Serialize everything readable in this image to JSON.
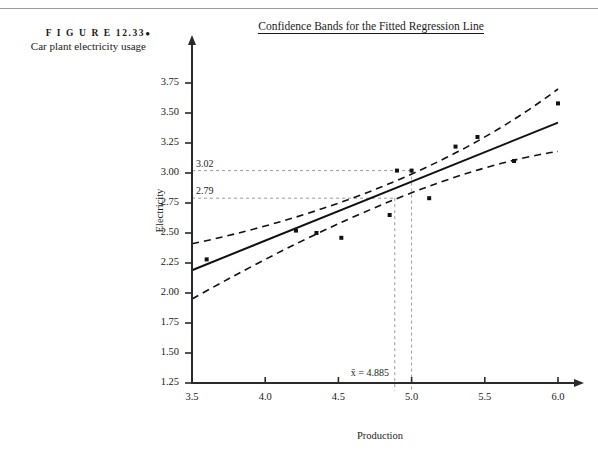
{
  "figure": {
    "label": "F I G U R E  12.33",
    "bullet": "●",
    "description": "Car plant electricity usage"
  },
  "chart_title": "Confidence Bands for the Fitted Regression Line",
  "chart_data": {
    "type": "scatter",
    "title": "Confidence Bands for the Fitted Regression Line",
    "xlabel": "Production",
    "ylabel": "Electricity",
    "xlim": [
      3.5,
      6.0
    ],
    "ylim": [
      1.25,
      3.75
    ],
    "xticks": [
      "3.5",
      "4.0",
      "4.5",
      "5.0",
      "5.5",
      "6.0"
    ],
    "xtick_values": [
      3.5,
      4.0,
      4.5,
      5.0,
      5.5,
      6.0
    ],
    "yticks": [
      "1.25",
      "1.50",
      "1.75",
      "2.00",
      "2.25",
      "2.50",
      "2.75",
      "3.00",
      "3.25",
      "3.50",
      "3.75"
    ],
    "ytick_values": [
      1.25,
      1.5,
      1.75,
      2.0,
      2.25,
      2.5,
      2.75,
      3.0,
      3.25,
      3.5,
      3.75
    ],
    "grid": false,
    "legend": "none",
    "points": [
      {
        "x": 3.6,
        "y": 2.28
      },
      {
        "x": 4.21,
        "y": 2.52
      },
      {
        "x": 4.35,
        "y": 2.5
      },
      {
        "x": 4.52,
        "y": 2.46
      },
      {
        "x": 4.85,
        "y": 2.65
      },
      {
        "x": 4.9,
        "y": 3.02
      },
      {
        "x": 5.0,
        "y": 3.02
      },
      {
        "x": 5.12,
        "y": 2.79
      },
      {
        "x": 5.3,
        "y": 3.22
      },
      {
        "x": 5.45,
        "y": 3.3
      },
      {
        "x": 5.7,
        "y": 3.1
      },
      {
        "x": 6.0,
        "y": 3.58
      }
    ],
    "regression_line": {
      "x1": 3.5,
      "y1": 2.19,
      "x2": 6.0,
      "y2": 3.42
    },
    "upper_band": [
      {
        "x": 3.5,
        "y": 2.41
      },
      {
        "x": 4.885,
        "y": 2.93
      },
      {
        "x": 6.0,
        "y": 3.7
      }
    ],
    "lower_band": [
      {
        "x": 3.5,
        "y": 1.95
      },
      {
        "x": 4.885,
        "y": 2.78
      },
      {
        "x": 6.0,
        "y": 3.18
      }
    ],
    "annotations": {
      "hline_upper_value": "3.02",
      "hline_upper_y": 3.02,
      "hline_lower_value": "2.79",
      "hline_lower_y": 2.79,
      "xbar_label": "x̄ = 4.885",
      "xbar_value": 4.885,
      "vline_x": 5.0
    },
    "colors": {
      "axis": "#2a2a2a",
      "point": "#111111",
      "fit_line": "#111111",
      "band": "#111111",
      "guide": "#9a9a9a"
    }
  }
}
